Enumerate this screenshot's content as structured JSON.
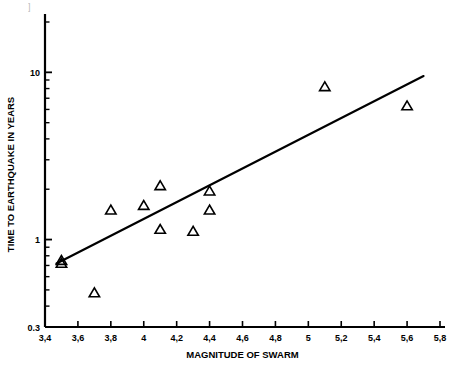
{
  "chart_data": {
    "type": "scatter",
    "title": "",
    "xlabel": "MAGNITUDE OF SWARM",
    "ylabel": "TIME TO EARTHQUAKE IN YEARS",
    "xscale": "linear",
    "yscale": "log",
    "xlim": [
      3.4,
      5.8
    ],
    "ylim": [
      0.3,
      20
    ],
    "grid": false,
    "legend": null,
    "xticks": [
      3.4,
      3.6,
      3.8,
      4.0,
      4.2,
      4.4,
      4.6,
      4.8,
      5.0,
      5.2,
      5.4,
      5.6,
      5.8
    ],
    "xticklabels": [
      "3,4",
      "3,6",
      "3,8",
      "4",
      "4,2",
      "4,4",
      "4,6",
      "4,8",
      "5",
      "5,2",
      "5,4",
      "5,6",
      "5,8"
    ],
    "yticks": [
      0.3,
      1,
      10
    ],
    "yticklabels": [
      "0.3",
      "1",
      "10"
    ],
    "yminorticks": [
      0.4,
      0.5,
      0.6,
      0.7,
      0.8,
      0.9,
      2,
      3,
      4,
      5,
      6,
      7,
      8,
      9,
      20
    ],
    "marker": "triangle-up-open",
    "marker_color": "#000000",
    "points": [
      {
        "x": 3.5,
        "y": 0.75
      },
      {
        "x": 3.5,
        "y": 0.72
      },
      {
        "x": 3.7,
        "y": 0.48
      },
      {
        "x": 3.8,
        "y": 1.5
      },
      {
        "x": 4.0,
        "y": 1.6
      },
      {
        "x": 4.1,
        "y": 2.1
      },
      {
        "x": 4.1,
        "y": 1.15
      },
      {
        "x": 4.3,
        "y": 1.12
      },
      {
        "x": 4.4,
        "y": 1.95
      },
      {
        "x": 4.4,
        "y": 1.5
      },
      {
        "x": 5.1,
        "y": 8.2
      },
      {
        "x": 5.6,
        "y": 6.3
      }
    ],
    "fit_line": {
      "type": "linear-on-log",
      "x_start": 3.47,
      "y_start": 0.72,
      "x_end": 5.7,
      "y_end": 9.5,
      "color": "#000000",
      "width": 2.2
    },
    "axis_color": "#000000",
    "background": "#ffffff",
    "page_artifact": "]"
  }
}
